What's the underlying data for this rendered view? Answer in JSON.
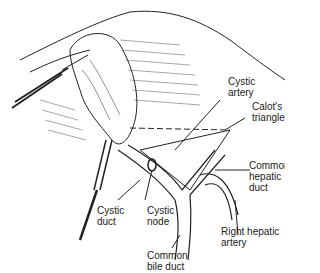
{
  "diagram": {
    "labels": [
      {
        "id": "cystic-artery",
        "lines": [
          "Cystic",
          "artery"
        ]
      },
      {
        "id": "calots-triangle",
        "lines": [
          "Calot's",
          "triangle"
        ]
      },
      {
        "id": "common-hepatic-duct",
        "lines": [
          "Common",
          "hepatic",
          "duct"
        ]
      },
      {
        "id": "right-hepatic-artery",
        "lines": [
          "Right hepatic",
          "artery"
        ]
      },
      {
        "id": "cystic-duct",
        "lines": [
          "Cystic",
          "duct"
        ]
      },
      {
        "id": "cystic-node",
        "lines": [
          "Cystic",
          "node"
        ]
      },
      {
        "id": "common-bile-duct",
        "lines": [
          "Common",
          "bile duct"
        ]
      }
    ],
    "colors": {
      "ink": "#222222",
      "background": "#ffffff"
    }
  }
}
